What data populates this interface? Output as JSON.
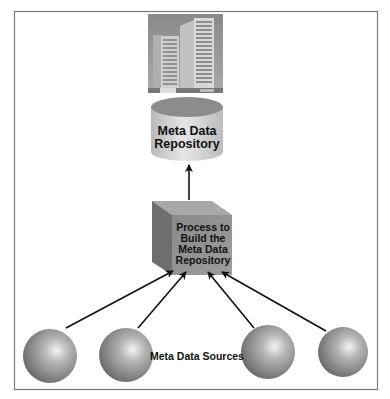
{
  "diagram": {
    "repository": {
      "label_line1": "Meta Data",
      "label_line2": "Repository"
    },
    "process": {
      "label_line1": "Process to",
      "label_line2": "Build the",
      "label_line3": "Meta Data",
      "label_line4": "Repository"
    },
    "sources": {
      "label": "Meta Data Sources",
      "count": 4
    },
    "building_icon": "office-building-photo",
    "colors": {
      "frame": "#7a7a7a",
      "cylinder_top": "#8c8c8c",
      "cylinder_body": "#d4d4d4",
      "cube_front": "#8e8e8e",
      "cube_side": "#6e6e6e",
      "cube_top": "#a8a8a8",
      "sphere": "#9a9a9a",
      "arrow": "#111111"
    }
  }
}
